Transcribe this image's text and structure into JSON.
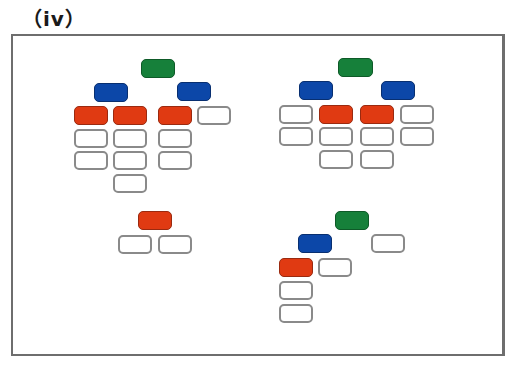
{
  "figure": {
    "label": "（iv）",
    "colors": {
      "green": "#16803a",
      "blue": "#0c47a8",
      "red": "#e03a12",
      "white": "#ffffff",
      "border": "#8a8a8a"
    },
    "trees": [
      {
        "id": "tree-top-left",
        "nodes": [
          {
            "color": "green",
            "x": 141,
            "y": 59,
            "w": 34,
            "h": 19
          },
          {
            "color": "blue",
            "x": 94,
            "y": 83,
            "w": 34,
            "h": 19
          },
          {
            "color": "blue",
            "x": 177,
            "y": 82,
            "w": 34,
            "h": 19
          },
          {
            "color": "red",
            "x": 74,
            "y": 106,
            "w": 34,
            "h": 19
          },
          {
            "color": "red",
            "x": 113,
            "y": 106,
            "w": 34,
            "h": 19
          },
          {
            "color": "red",
            "x": 158,
            "y": 106,
            "w": 34,
            "h": 19
          },
          {
            "color": "white",
            "x": 197,
            "y": 106,
            "w": 34,
            "h": 19
          },
          {
            "color": "white",
            "x": 74,
            "y": 129,
            "w": 34,
            "h": 19
          },
          {
            "color": "white",
            "x": 113,
            "y": 129,
            "w": 34,
            "h": 19
          },
          {
            "color": "white",
            "x": 158,
            "y": 129,
            "w": 34,
            "h": 19
          },
          {
            "color": "white",
            "x": 74,
            "y": 151,
            "w": 34,
            "h": 19
          },
          {
            "color": "white",
            "x": 113,
            "y": 151,
            "w": 34,
            "h": 19
          },
          {
            "color": "white",
            "x": 158,
            "y": 151,
            "w": 34,
            "h": 19
          },
          {
            "color": "white",
            "x": 113,
            "y": 174,
            "w": 34,
            "h": 19
          }
        ]
      },
      {
        "id": "tree-top-right",
        "nodes": [
          {
            "color": "green",
            "x": 338,
            "y": 58,
            "w": 35,
            "h": 19
          },
          {
            "color": "blue",
            "x": 299,
            "y": 81,
            "w": 34,
            "h": 19
          },
          {
            "color": "blue",
            "x": 381,
            "y": 81,
            "w": 34,
            "h": 19
          },
          {
            "color": "white",
            "x": 279,
            "y": 105,
            "w": 34,
            "h": 19
          },
          {
            "color": "red",
            "x": 319,
            "y": 105,
            "w": 34,
            "h": 19
          },
          {
            "color": "red",
            "x": 360,
            "y": 105,
            "w": 34,
            "h": 19
          },
          {
            "color": "white",
            "x": 400,
            "y": 105,
            "w": 34,
            "h": 19
          },
          {
            "color": "white",
            "x": 279,
            "y": 127,
            "w": 34,
            "h": 19
          },
          {
            "color": "white",
            "x": 319,
            "y": 127,
            "w": 34,
            "h": 19
          },
          {
            "color": "white",
            "x": 360,
            "y": 127,
            "w": 34,
            "h": 19
          },
          {
            "color": "white",
            "x": 400,
            "y": 127,
            "w": 34,
            "h": 19
          },
          {
            "color": "white",
            "x": 319,
            "y": 150,
            "w": 34,
            "h": 19
          },
          {
            "color": "white",
            "x": 360,
            "y": 150,
            "w": 34,
            "h": 19
          }
        ]
      },
      {
        "id": "tree-bottom-left",
        "nodes": [
          {
            "color": "red",
            "x": 138,
            "y": 211,
            "w": 34,
            "h": 19
          },
          {
            "color": "white",
            "x": 118,
            "y": 235,
            "w": 34,
            "h": 19
          },
          {
            "color": "white",
            "x": 158,
            "y": 235,
            "w": 34,
            "h": 19
          }
        ]
      },
      {
        "id": "tree-bottom-right",
        "nodes": [
          {
            "color": "green",
            "x": 335,
            "y": 211,
            "w": 34,
            "h": 19
          },
          {
            "color": "blue",
            "x": 298,
            "y": 234,
            "w": 34,
            "h": 19
          },
          {
            "color": "white",
            "x": 371,
            "y": 234,
            "w": 34,
            "h": 19
          },
          {
            "color": "red",
            "x": 279,
            "y": 258,
            "w": 34,
            "h": 19
          },
          {
            "color": "white",
            "x": 318,
            "y": 258,
            "w": 34,
            "h": 19
          },
          {
            "color": "white",
            "x": 279,
            "y": 281,
            "w": 34,
            "h": 19
          },
          {
            "color": "white",
            "x": 279,
            "y": 304,
            "w": 34,
            "h": 19
          }
        ]
      }
    ]
  }
}
